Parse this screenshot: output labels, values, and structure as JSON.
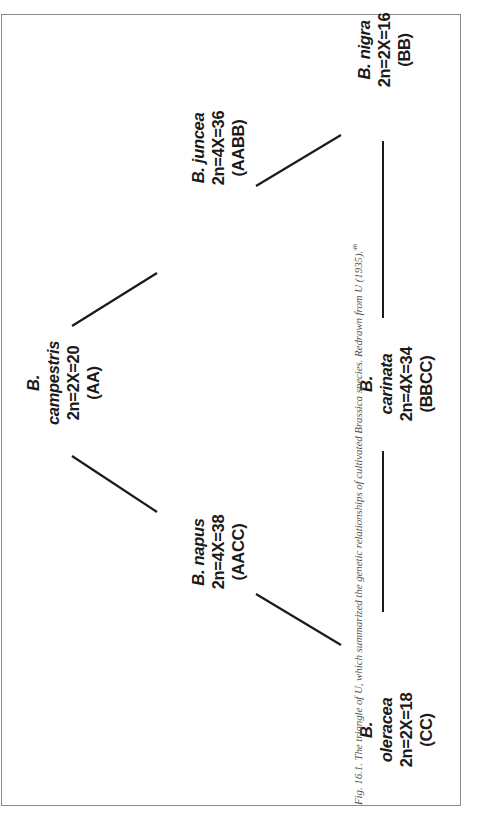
{
  "figure": {
    "caption": {
      "label": "Fig. 16.1.",
      "text": "The triangle of U, which summarized the genetic relationships of cultivated Brassica species. Redrawn from U (1935).",
      "reference": "46"
    },
    "nodes": [
      {
        "id": "campestris",
        "genus": "B.",
        "species": "campestris",
        "chromosomes": "2n=2X=20",
        "genome": "(AA)"
      },
      {
        "id": "juncea",
        "genus": "B.",
        "species": "juncea",
        "chromosomes": "2n=4X=36",
        "genome": "(AABB)"
      },
      {
        "id": "nigra",
        "genus": "B.",
        "species": "nigra",
        "chromosomes": "2n=2X=16",
        "genome": "(BB)"
      },
      {
        "id": "napus",
        "genus": "B.",
        "species": "napus",
        "chromosomes": "2n=4X=38",
        "genome": "(AACC)"
      },
      {
        "id": "carinata",
        "genus": "B.",
        "species": "carinata",
        "chromosomes": "2n=4X=34",
        "genome": "(BBCC)"
      },
      {
        "id": "oleracea",
        "genus": "B.",
        "species": "oleracea",
        "chromosomes": "2n=2X=18",
        "genome": "(CC)"
      }
    ],
    "edges": [
      {
        "from": "campestris",
        "to": "juncea"
      },
      {
        "from": "juncea",
        "to": "nigra"
      },
      {
        "from": "campestris",
        "to": "napus"
      },
      {
        "from": "napus",
        "to": "oleracea"
      },
      {
        "from": "nigra",
        "to": "carinata"
      },
      {
        "from": "carinata",
        "to": "oleracea"
      }
    ],
    "colors": {
      "line": "#1a1a1a",
      "frame": "#8a8a8a",
      "caption": "#555555"
    }
  }
}
